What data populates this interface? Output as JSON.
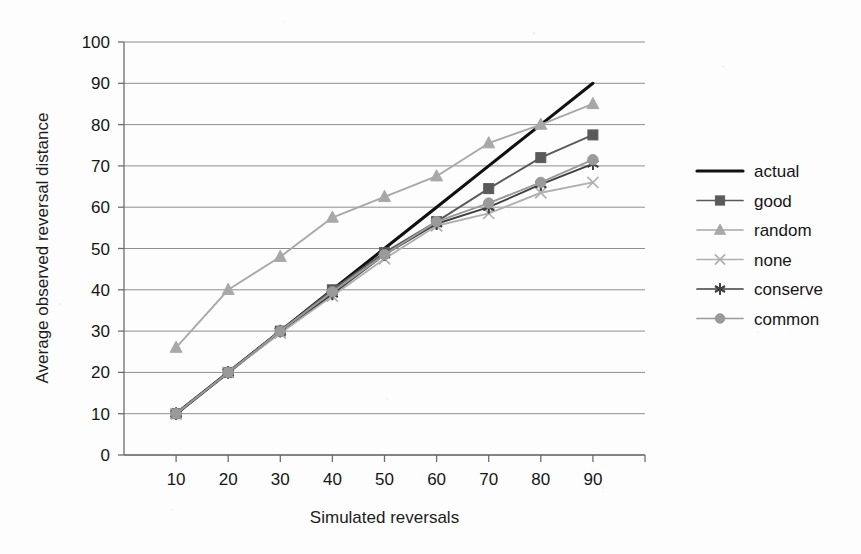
{
  "chart_data": {
    "type": "line",
    "title": "",
    "xlabel": "Simulated reversals",
    "ylabel": "Average observed reversal distance",
    "x": [
      10,
      20,
      30,
      40,
      50,
      60,
      70,
      80,
      90
    ],
    "xlim": [
      0,
      100
    ],
    "ylim": [
      0,
      100
    ],
    "xticks": [
      "10",
      "20",
      "30",
      "40",
      "50",
      "60",
      "70",
      "80",
      "90"
    ],
    "yticks": [
      "0",
      "10",
      "20",
      "30",
      "40",
      "50",
      "60",
      "70",
      "80",
      "90",
      "100"
    ],
    "grid": "horizontal",
    "legend_position": "right",
    "series": [
      {
        "name": "actual",
        "marker": "none",
        "color": "#111111",
        "values": [
          10,
          20,
          30,
          40,
          50,
          60,
          70,
          80,
          90
        ]
      },
      {
        "name": "good",
        "marker": "square",
        "color": "#5a5a5a",
        "values": [
          10,
          20,
          30,
          40,
          49,
          56.5,
          64.5,
          72,
          77.5
        ]
      },
      {
        "name": "random",
        "marker": "triangle",
        "color": "#a8a8a8",
        "values": [
          26,
          40,
          48,
          57.5,
          62.5,
          67.5,
          75.5,
          80,
          85
        ]
      },
      {
        "name": "none",
        "marker": "x",
        "color": "#b0b0b0",
        "values": [
          10,
          20,
          29.5,
          38.5,
          47.5,
          55.5,
          58.5,
          63.5,
          66
        ]
      },
      {
        "name": "conserve",
        "marker": "asterisk",
        "color": "#3f3f3f",
        "values": [
          10,
          20,
          30,
          39,
          48.5,
          56,
          60,
          65.5,
          70.5
        ]
      },
      {
        "name": "common",
        "marker": "circle",
        "color": "#9a9a9a",
        "values": [
          10,
          20,
          30,
          39.5,
          48.5,
          56.5,
          61,
          66,
          71.5
        ]
      }
    ]
  },
  "axes": {
    "x_title": "Simulated reversals",
    "y_title": "Average observed reversal distance"
  },
  "legend": {
    "items": [
      {
        "label": "actual"
      },
      {
        "label": "good"
      },
      {
        "label": "random"
      },
      {
        "label": "none"
      },
      {
        "label": "conserve"
      },
      {
        "label": "common"
      }
    ]
  }
}
